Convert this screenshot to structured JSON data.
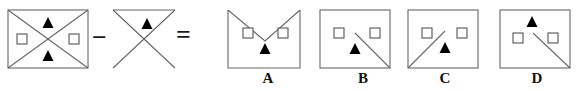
{
  "puzzle": {
    "type": "visual-analogy-subtraction",
    "operators": {
      "minus": "−",
      "equals": "="
    },
    "stroke_color": "#666666",
    "fill_color": "#000000",
    "square_fill": "#ffffff",
    "label_color": "#111111",
    "figures": {
      "minuend": {
        "name": "rectangle-with-both-diagonals",
        "description": "Rectangle with both diagonals forming an X, black triangle in top sector, black triangle in bottom sector, white square in left sector, white square in right sector",
        "box": {
          "x": 8,
          "y": 10,
          "w": 80,
          "h": 58
        },
        "markers": [
          {
            "kind": "triangle",
            "fill": "#000000",
            "cx": 48,
            "cy": 23
          },
          {
            "kind": "triangle",
            "fill": "#000000",
            "cx": 48,
            "cy": 56
          },
          {
            "kind": "square",
            "fill": "#ffffff",
            "cx": 22,
            "cy": 39
          },
          {
            "kind": "square",
            "fill": "#ffffff",
            "cx": 74,
            "cy": 39
          }
        ]
      },
      "subtrahend": {
        "name": "top-triangle-with-tail-diagonal",
        "description": "Top horizontal edge with two diagonals meeting at center, one diagonal extending to the bottom-left corner; black triangle inside the upper triangle",
        "box": {
          "x": 113,
          "y": 10,
          "w": 62,
          "h": 58
        },
        "markers": [
          {
            "kind": "triangle",
            "fill": "#000000",
            "cx": 147,
            "cy": 24
          }
        ]
      }
    },
    "choices": [
      {
        "id": "A",
        "label": "A",
        "name": "choice-a",
        "description": "Rectangle with V-shaped notch removed from the top; two white squares left and right, black triangle at bottom centre",
        "box": {
          "x": 228,
          "y": 10,
          "w": 72,
          "h": 58
        },
        "label_x": 253,
        "markers": [
          {
            "kind": "square",
            "fill": "#ffffff",
            "cx": 248,
            "cy": 33
          },
          {
            "kind": "square",
            "fill": "#ffffff",
            "cx": 283,
            "cy": 33
          },
          {
            "kind": "triangle",
            "fill": "#000000",
            "cx": 265,
            "cy": 48
          }
        ]
      },
      {
        "id": "B",
        "label": "B",
        "name": "choice-b",
        "description": "Full rectangle with a diagonal from centre down to the bottom-right corner; two white squares, black triangle at bottom centre",
        "box": {
          "x": 320,
          "y": 10,
          "w": 70,
          "h": 58
        },
        "label_x": 348,
        "markers": [
          {
            "kind": "square",
            "fill": "#ffffff",
            "cx": 339,
            "cy": 33
          },
          {
            "kind": "square",
            "fill": "#ffffff",
            "cx": 375,
            "cy": 33
          },
          {
            "kind": "triangle",
            "fill": "#000000",
            "cx": 355,
            "cy": 48
          }
        ]
      },
      {
        "id": "C",
        "label": "C",
        "name": "choice-c",
        "description": "Full rectangle with a diagonal from the bottom-left corner up to centre; two white squares, black triangle at bottom centre",
        "box": {
          "x": 408,
          "y": 10,
          "w": 70,
          "h": 58
        },
        "label_x": 430,
        "markers": [
          {
            "kind": "square",
            "fill": "#ffffff",
            "cx": 427,
            "cy": 33
          },
          {
            "kind": "square",
            "fill": "#ffffff",
            "cx": 462,
            "cy": 33
          },
          {
            "kind": "triangle",
            "fill": "#000000",
            "cx": 445,
            "cy": 47
          }
        ]
      },
      {
        "id": "D",
        "label": "D",
        "name": "choice-d",
        "description": "Full rectangle with a diagonal from centre down to the bottom-right corner; black triangle near top centre and two white squares below",
        "box": {
          "x": 500,
          "y": 10,
          "w": 70,
          "h": 58
        },
        "label_x": 522,
        "markers": [
          {
            "kind": "triangle",
            "fill": "#000000",
            "cx": 532,
            "cy": 22
          },
          {
            "kind": "square",
            "fill": "#ffffff",
            "cx": 518,
            "cy": 38
          },
          {
            "kind": "square",
            "fill": "#ffffff",
            "cx": 553,
            "cy": 38
          }
        ]
      }
    ]
  }
}
